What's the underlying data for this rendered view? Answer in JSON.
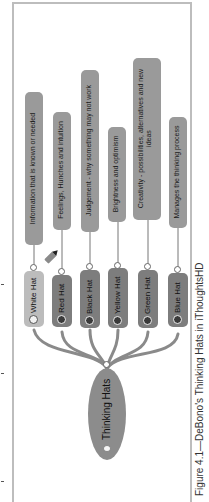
{
  "figure": {
    "caption": "Figure 4.1—DeBono's Thinking Hats in iThoughtsHD",
    "orientation": "rotated 90° counter-clockwise"
  },
  "mindmap": {
    "central": {
      "label": "Thinking Hats",
      "icon": "lightbulb-icon"
    },
    "branches": [
      {
        "label": "White Hat",
        "icon": "white-hat-icon",
        "description": "Information that is known or needed"
      },
      {
        "label": "Red Hat",
        "icon": "red-hat-icon",
        "description": "Feelings, Hunches and intuition"
      },
      {
        "label": "Black Hat",
        "icon": "black-hat-icon",
        "description": "Judgement - why something may not work"
      },
      {
        "label": "Yellow Hat",
        "icon": "yellow-hat-icon",
        "description": "Brightness and optimism"
      },
      {
        "label": "Green Hat",
        "icon": "green-hat-icon",
        "description": "Creativity - possibilities, alternatives and new ideas"
      },
      {
        "label": "Blue Hat",
        "icon": "blue-hat-icon",
        "description": "Manages the thinking process"
      }
    ],
    "extra_icon": "pencil-icon"
  },
  "colors": {
    "frame": "#bdbdbd",
    "node": "#7d7d7d",
    "white_node": "#bcbcbc",
    "description_box": "#9a9a9a",
    "central_node": "#8c8c8c",
    "link": "#8a8a8a"
  }
}
